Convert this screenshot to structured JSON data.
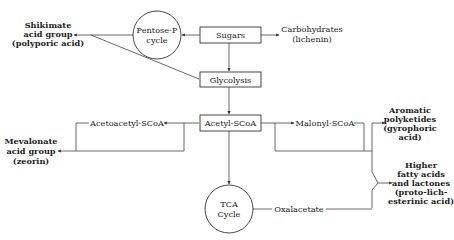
{
  "diagram": {
    "nodes": {
      "sugars": {
        "label": "Sugars",
        "shape": "box"
      },
      "pentose": {
        "label_line1": "Pentose-P",
        "label_line2": "cycle",
        "shape": "circle"
      },
      "shikimate": {
        "line1": "Shikimate",
        "line2": "acid group",
        "line3": "(polyporic acid)"
      },
      "carbohydrates": {
        "line1": "Carbohydrates",
        "line2": "(lichenin)"
      },
      "glycolysis": {
        "label": "Glycolysis",
        "shape": "box"
      },
      "acetyl": {
        "label": "Acetyl-SCoA",
        "shape": "box"
      },
      "acetoacetyl": {
        "label": "Acetoacetyl-SCoA"
      },
      "mevalonate": {
        "line1": "Mevalonate",
        "line2": "acid group",
        "line3": "(zeorin)"
      },
      "malonyl": {
        "label": "Malonyl-SCoA"
      },
      "aromatic": {
        "line1": "Aromatic",
        "line2": "polyketides",
        "line3": "(gyrophoric",
        "line4": "acid)"
      },
      "fatty": {
        "line1": "Higher",
        "line2": "fatty acids",
        "line3": "and lactones",
        "line4": "(proto-lich-",
        "line5": "esterinic acid)"
      },
      "tca": {
        "label_line1": "TCA",
        "label_line2": "Cycle",
        "shape": "circle"
      },
      "oxalacetate": {
        "label": "Oxalacetate"
      }
    },
    "edges": [
      {
        "from": "Sugars",
        "to": "Pentose-P cycle"
      },
      {
        "from": "Pentose-P cycle",
        "to": "Shikimate acid group"
      },
      {
        "from": "Glycolysis",
        "to": "Shikimate acid group"
      },
      {
        "from": "Sugars",
        "to": "Carbohydrates"
      },
      {
        "from": "Sugars",
        "to": "Glycolysis"
      },
      {
        "from": "Glycolysis",
        "to": "Acetyl-SCoA"
      },
      {
        "from": "Acetyl-SCoA",
        "to": "Acetoacetyl-SCoA"
      },
      {
        "from": "Acetoacetyl-SCoA",
        "to": "Mevalonate acid group"
      },
      {
        "from": "Acetyl-SCoA",
        "to": "Malonyl-SCoA"
      },
      {
        "from": "Malonyl-SCoA",
        "to": "Aromatic polyketides"
      },
      {
        "from": "Malonyl-SCoA",
        "to": "Higher fatty acids and lactones"
      },
      {
        "from": "Acetyl-SCoA",
        "to": "TCA Cycle"
      },
      {
        "from": "TCA Cycle",
        "to": "Oxalacetate"
      },
      {
        "from": "Oxalacetate",
        "to": "Higher fatty acids and lactones"
      }
    ]
  }
}
